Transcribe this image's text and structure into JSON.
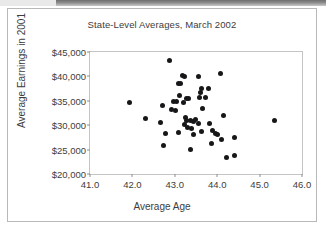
{
  "chart_data": {
    "type": "scatter",
    "title": "State-Level Averages, March 2002",
    "xlabel": "Average Age",
    "ylabel": "Average Earnings in 2001",
    "xlim": [
      41.0,
      46.0
    ],
    "ylim": [
      20000,
      45000
    ],
    "xticks": [
      "41.0",
      "42.0",
      "43.0",
      "44.0",
      "45.0",
      "46.0"
    ],
    "xtick_values": [
      41.0,
      42.0,
      43.0,
      44.0,
      45.0,
      46.0
    ],
    "yticks": [
      "$20,000",
      "$25,000",
      "$30,000",
      "$35,000",
      "$40,000",
      "$45,000"
    ],
    "ytick_values": [
      20000,
      25000,
      30000,
      35000,
      40000,
      45000
    ],
    "grid": false,
    "legend": null,
    "marker_color": "#17171a",
    "point_count": 51,
    "points": [
      {
        "x": 42.88,
        "y": 43300
      },
      {
        "x": 44.08,
        "y": 40600
      },
      {
        "x": 43.18,
        "y": 40100
      },
      {
        "x": 43.22,
        "y": 39900
      },
      {
        "x": 43.55,
        "y": 39900
      },
      {
        "x": 43.08,
        "y": 38600
      },
      {
        "x": 43.14,
        "y": 38500
      },
      {
        "x": 43.62,
        "y": 37600
      },
      {
        "x": 43.8,
        "y": 37500
      },
      {
        "x": 43.6,
        "y": 36600
      },
      {
        "x": 43.1,
        "y": 36100
      },
      {
        "x": 41.92,
        "y": 34700
      },
      {
        "x": 42.96,
        "y": 34900
      },
      {
        "x": 43.05,
        "y": 34800
      },
      {
        "x": 43.28,
        "y": 35500
      },
      {
        "x": 43.33,
        "y": 35400
      },
      {
        "x": 43.58,
        "y": 35700
      },
      {
        "x": 43.72,
        "y": 35600
      },
      {
        "x": 43.2,
        "y": 34600
      },
      {
        "x": 42.7,
        "y": 34100
      },
      {
        "x": 42.92,
        "y": 33200
      },
      {
        "x": 43.02,
        "y": 33100
      },
      {
        "x": 43.66,
        "y": 33500
      },
      {
        "x": 44.14,
        "y": 31900
      },
      {
        "x": 42.32,
        "y": 31300
      },
      {
        "x": 42.66,
        "y": 30500
      },
      {
        "x": 43.25,
        "y": 31600
      },
      {
        "x": 43.28,
        "y": 31000
      },
      {
        "x": 43.38,
        "y": 30900
      },
      {
        "x": 43.45,
        "y": 30800
      },
      {
        "x": 43.48,
        "y": 31100
      },
      {
        "x": 43.55,
        "y": 30300
      },
      {
        "x": 43.82,
        "y": 30400
      },
      {
        "x": 45.34,
        "y": 30900
      },
      {
        "x": 43.22,
        "y": 30200
      },
      {
        "x": 43.3,
        "y": 29500
      },
      {
        "x": 43.4,
        "y": 29300
      },
      {
        "x": 43.62,
        "y": 28800
      },
      {
        "x": 43.9,
        "y": 28900
      },
      {
        "x": 43.96,
        "y": 28400
      },
      {
        "x": 44.0,
        "y": 28000
      },
      {
        "x": 42.78,
        "y": 28400
      },
      {
        "x": 43.08,
        "y": 28600
      },
      {
        "x": 43.44,
        "y": 28100
      },
      {
        "x": 43.86,
        "y": 26300
      },
      {
        "x": 44.1,
        "y": 27000
      },
      {
        "x": 44.4,
        "y": 27500
      },
      {
        "x": 42.74,
        "y": 25900
      },
      {
        "x": 43.36,
        "y": 25000
      },
      {
        "x": 44.22,
        "y": 23400
      },
      {
        "x": 44.4,
        "y": 23800
      }
    ]
  }
}
